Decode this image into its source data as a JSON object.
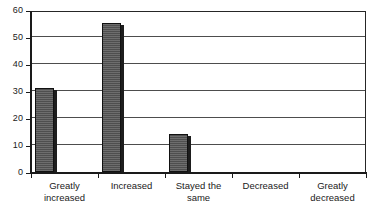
{
  "chart_data": {
    "type": "bar",
    "title": "",
    "xlabel": "",
    "ylabel": "",
    "categories": [
      "Greatly\nincreased",
      "Increased",
      "Stayed the\nsame",
      "Decreased",
      "Greatly\ndecreased"
    ],
    "values": [
      31,
      55,
      14,
      0,
      0
    ],
    "ylim": [
      0,
      60
    ],
    "yticks": [
      0,
      10,
      20,
      30,
      40,
      50,
      60
    ],
    "ytick_labels": [
      "0",
      "10",
      "20",
      "30",
      "40",
      "50",
      "60"
    ],
    "grid": true,
    "grid_axis": "y",
    "legend": false,
    "legend_position": "none",
    "series": [
      {
        "name": "",
        "values": [
          31,
          55,
          14,
          0,
          0
        ]
      }
    ],
    "colors": {
      "bar_fill": "#585858",
      "bar_edge": "#111111",
      "bar_shadow": "#1d1d1d",
      "gridline": "#4d4d4d",
      "axis": "#1a1a1a",
      "plot_background": "#ffffff",
      "text": "#1a1a1a"
    }
  }
}
